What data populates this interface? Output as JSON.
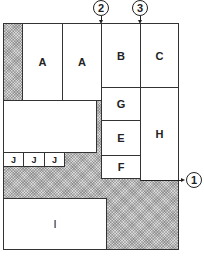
{
  "diagram": {
    "type": "floor-plan",
    "fill": {
      "open_area": "hatched",
      "rooms": "#ffffff",
      "lines": "#222222"
    },
    "rooms": [
      {
        "id": "A1",
        "label": "A"
      },
      {
        "id": "A2",
        "label": "A"
      },
      {
        "id": "B",
        "label": "B"
      },
      {
        "id": "C",
        "label": "C"
      },
      {
        "id": "G",
        "label": "G"
      },
      {
        "id": "E",
        "label": "E"
      },
      {
        "id": "F",
        "label": "F"
      },
      {
        "id": "H",
        "label": "H"
      },
      {
        "id": "big",
        "label": ""
      },
      {
        "id": "J1",
        "label": "J"
      },
      {
        "id": "J2",
        "label": "J"
      },
      {
        "id": "J3",
        "label": "J"
      },
      {
        "id": "I",
        "label": "I"
      }
    ],
    "markers": [
      {
        "id": "m1",
        "label": "1"
      },
      {
        "id": "m2",
        "label": "2"
      },
      {
        "id": "m3",
        "label": "3"
      }
    ]
  }
}
